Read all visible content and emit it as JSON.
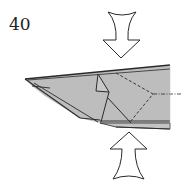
{
  "diagram": {
    "step_number": "40",
    "colors": {
      "paper": "#bdbdbd",
      "paper_light": "#c9c9c9",
      "line": "#2a2a2a",
      "arrow_fill": "#ffffff"
    },
    "arrows": [
      {
        "name": "push-arrow-top",
        "direction": "down"
      },
      {
        "name": "push-arrow-bottom",
        "direction": "up"
      }
    ],
    "lines": [
      {
        "name": "valley-fold-line",
        "style": "dashed"
      },
      {
        "name": "center-axis-line",
        "style": "dash-dot"
      }
    ]
  }
}
